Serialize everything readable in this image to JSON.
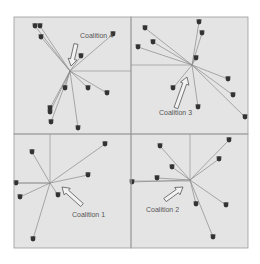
{
  "figure": {
    "background": "#ffffff",
    "panel_fill": "#e4e4e4",
    "border_color": "#9a9a9a",
    "edge_color": "#8a8a8a",
    "node_color": "#333333",
    "arrow_stroke": "#555555",
    "arrow_fill": "#f2f2f2"
  },
  "panels": [
    {
      "id": "coalition-4",
      "label": "Coalition 4",
      "label_pos": [
        80,
        38
      ],
      "hub": [
        70,
        71
      ],
      "gridlines": [
        [
          70,
          71,
          131,
          71
        ]
      ],
      "nodes": [
        [
          35,
          26
        ],
        [
          40,
          26
        ],
        [
          41,
          37
        ],
        [
          113,
          34
        ],
        [
          81,
          56
        ],
        [
          65,
          88
        ],
        [
          88,
          88
        ],
        [
          107,
          93
        ],
        [
          50,
          108
        ],
        [
          50,
          112
        ],
        [
          51,
          122
        ],
        [
          78,
          128
        ]
      ],
      "arrow": {
        "from": [
          76,
          44
        ],
        "to": [
          71,
          66
        ]
      }
    },
    {
      "id": "coalition-3",
      "label": "Coalition 3",
      "label_pos": [
        159,
        115
      ],
      "hub": [
        192,
        65
      ],
      "gridlines": [
        [
          131,
          65,
          192,
          65
        ]
      ],
      "nodes": [
        [
          145,
          28
        ],
        [
          199,
          22
        ],
        [
          202,
          33
        ],
        [
          153,
          42
        ],
        [
          138,
          47
        ],
        [
          196,
          58
        ],
        [
          228,
          79
        ],
        [
          173,
          88
        ],
        [
          233,
          95
        ],
        [
          198,
          107
        ],
        [
          245,
          117
        ]
      ],
      "arrow": {
        "from": [
          176,
          108
        ],
        "to": [
          187,
          77
        ]
      }
    },
    {
      "id": "coalition-1",
      "label": "Coalition 1",
      "label_pos": [
        72,
        217
      ],
      "hub": [
        50,
        183
      ],
      "gridlines": [
        [
          50,
          134,
          50,
          183
        ],
        [
          14,
          183,
          50,
          183
        ]
      ],
      "nodes": [
        [
          32,
          152
        ],
        [
          105,
          144
        ],
        [
          88,
          175
        ],
        [
          16,
          183
        ],
        [
          20,
          197
        ],
        [
          58,
          195
        ],
        [
          33,
          239
        ]
      ],
      "arrow": {
        "from": [
          82,
          205
        ],
        "to": [
          62,
          187
        ]
      }
    },
    {
      "id": "coalition-2",
      "label": "Coalition 2",
      "label_pos": [
        146,
        212
      ],
      "hub": [
        190,
        180
      ],
      "gridlines": [
        [
          190,
          134,
          190,
          180
        ],
        [
          131,
          181,
          190,
          181
        ]
      ],
      "nodes": [
        [
          160,
          146
        ],
        [
          229,
          140
        ],
        [
          219,
          159
        ],
        [
          172,
          167
        ],
        [
          157,
          178
        ],
        [
          132,
          182
        ],
        [
          196,
          204
        ],
        [
          226,
          205
        ],
        [
          213,
          237
        ]
      ],
      "arrow": {
        "from": [
          165,
          200
        ],
        "to": [
          183,
          187
        ]
      }
    }
  ]
}
